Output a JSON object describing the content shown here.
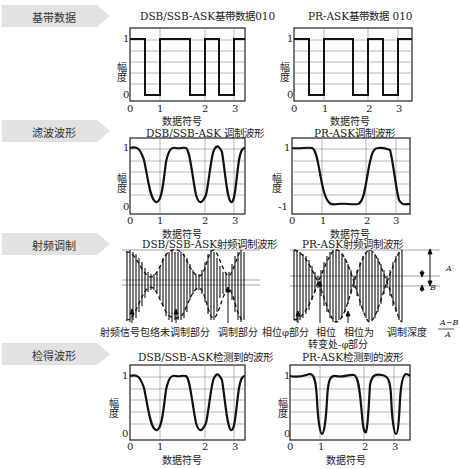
{
  "sections": [
    {
      "label": "基带数据"
    },
    {
      "label": "滤波波形"
    },
    {
      "label": "射频调制"
    },
    {
      "label": "检得波形"
    }
  ],
  "plots": {
    "baseband_dsb": {
      "title": "DSB/SSB-ASK基带数据010",
      "xlabel": "数据符号",
      "ylabel": "幅度",
      "yticks": [
        "1",
        "0"
      ],
      "xticks": [
        "0",
        "1",
        "2",
        "3"
      ]
    },
    "baseband_pr": {
      "title": "PR-ASK基带数据 010",
      "xlabel": "数据符号",
      "ylabel": "幅度",
      "yticks": [
        "1",
        "0"
      ],
      "xticks": [
        "0",
        "1",
        "2",
        "3"
      ]
    },
    "filtered_dsb": {
      "title": "DSB/SSB-ASK 调制波形",
      "xlabel": "数据符号",
      "ylabel": "幅度",
      "yticks": [
        "1",
        "0"
      ],
      "xticks": [
        "0",
        "1",
        "2",
        "3"
      ]
    },
    "filtered_pr": {
      "title": "PR-ASK调制波形",
      "xlabel": "数据符号",
      "ylabel": "幅度",
      "yticks": [
        "1",
        "-1"
      ],
      "xticks": [
        "0",
        "1",
        "2",
        "3"
      ]
    },
    "rf_dsb": {
      "title": "DSB/SSB-ASK射频调制波形"
    },
    "rf_pr": {
      "title": "PR-ASK射频调制波形"
    },
    "detected_dsb": {
      "title": "DSB/SSB-ASK检测到的波形",
      "xlabel": "数据符号",
      "ylabel": "幅度",
      "yticks": [
        "1",
        "0"
      ],
      "xticks": [
        "0",
        "1",
        "2",
        "3"
      ]
    },
    "detected_pr": {
      "title": "PR-ASK检测到的波形",
      "xlabel": "数据符号",
      "ylabel": "幅度",
      "yticks": [
        "1",
        "0"
      ],
      "xticks": [
        "0",
        "1",
        "2",
        "3"
      ]
    }
  },
  "annotations": {
    "rf_envelope": "射频信号包络",
    "unmodulated": "未调制部分",
    "modulated": "调制部分",
    "phase_phi": "相位φ部分",
    "phase_change_1": "相位",
    "phase_change_2": "转变处",
    "phase_neg_1": "相位为",
    "phase_neg_2": "-φ部分",
    "mod_depth": "调制深度",
    "formula_num": "A−B",
    "formula_den": "A",
    "label_A": "A",
    "label_B": "B"
  }
}
